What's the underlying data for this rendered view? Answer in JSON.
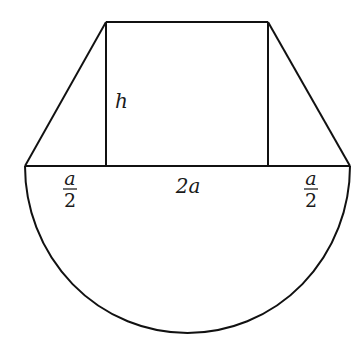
{
  "diagram": {
    "stroke_color": "#111111",
    "labels": {
      "height": "h",
      "left_segment": {
        "numerator": "a",
        "denominator": "2"
      },
      "middle_segment": "2a",
      "right_segment": {
        "numerator": "a",
        "denominator": "2"
      }
    },
    "shapes": {
      "trapezoid": {
        "top_left": [
          106,
          22
        ],
        "top_right": [
          268,
          22
        ],
        "bottom_left": [
          25,
          166
        ],
        "bottom_right": [
          350,
          166
        ]
      },
      "rectangle": {
        "x1": 106,
        "x2": 268,
        "y_top": 22,
        "y_bottom": 166
      },
      "semicircle": {
        "center": [
          187.5,
          166
        ],
        "rx": 162.5,
        "ry": 167
      }
    }
  }
}
